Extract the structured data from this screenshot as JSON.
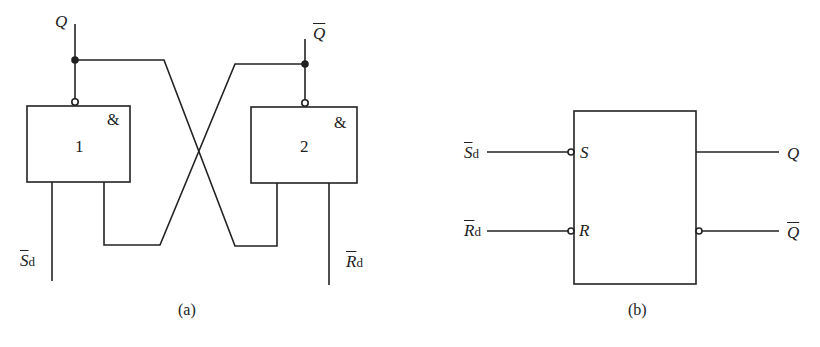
{
  "figure_a": {
    "caption": "(a)",
    "gate1": {
      "number": "1",
      "symbol": "&"
    },
    "gate2": {
      "number": "2",
      "symbol": "&"
    },
    "output_q": "Q",
    "output_qbar": "Q",
    "input_s": {
      "main": "S",
      "sub": "d"
    },
    "input_r": {
      "main": "R",
      "sub": "d"
    }
  },
  "figure_b": {
    "caption": "(b)",
    "pin_s": "S",
    "pin_r": "R",
    "input_s": {
      "main": "S",
      "sub": "d"
    },
    "input_r": {
      "main": "R",
      "sub": "d"
    },
    "output_q": "Q",
    "output_qbar": "Q"
  },
  "colors": {
    "line": "#222222",
    "background": "#ffffff"
  }
}
